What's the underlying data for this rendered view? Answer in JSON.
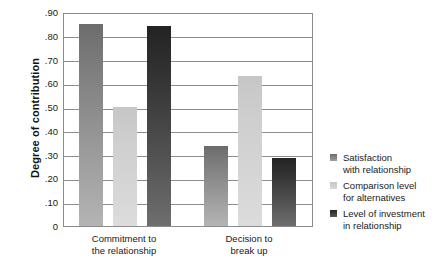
{
  "chart_data": {
    "type": "bar",
    "title": "",
    "xlabel": "",
    "ylabel": "Degree of contribution",
    "ylim": [
      0,
      0.9
    ],
    "yticks": [
      0.9,
      0.8,
      0.7,
      0.6,
      0.5,
      0.4,
      0.3,
      0.2,
      0.1,
      0
    ],
    "ytick_labels": [
      ".90",
      ".80",
      ".70",
      ".60",
      ".50",
      ".40",
      ".30",
      ".20",
      ".10",
      "0"
    ],
    "grid": true,
    "legend_position": "right",
    "categories": [
      "Commitment to the relationship",
      "Decision to break up"
    ],
    "category_lines": [
      [
        "Commitment to",
        "the relationship"
      ],
      [
        "Decision to",
        "break up"
      ]
    ],
    "series": [
      {
        "name": "Satisfaction with relationship",
        "legend_lines": [
          "Satisfaction",
          "with relationship"
        ],
        "color": "#7d7d7d",
        "values": [
          0.85,
          0.335
        ]
      },
      {
        "name": "Comparison level for alternatives",
        "legend_lines": [
          "Comparison level",
          "for alternatives"
        ],
        "color": "#cfcfcf",
        "values": [
          0.5,
          0.63
        ]
      },
      {
        "name": "Level of investment in relationship",
        "legend_lines": [
          "Level of investment",
          "in relationship"
        ],
        "color": "#2d2d2d",
        "values": [
          0.84,
          0.285
        ]
      }
    ]
  },
  "axes": {
    "y_title": "Degree of contribution"
  }
}
